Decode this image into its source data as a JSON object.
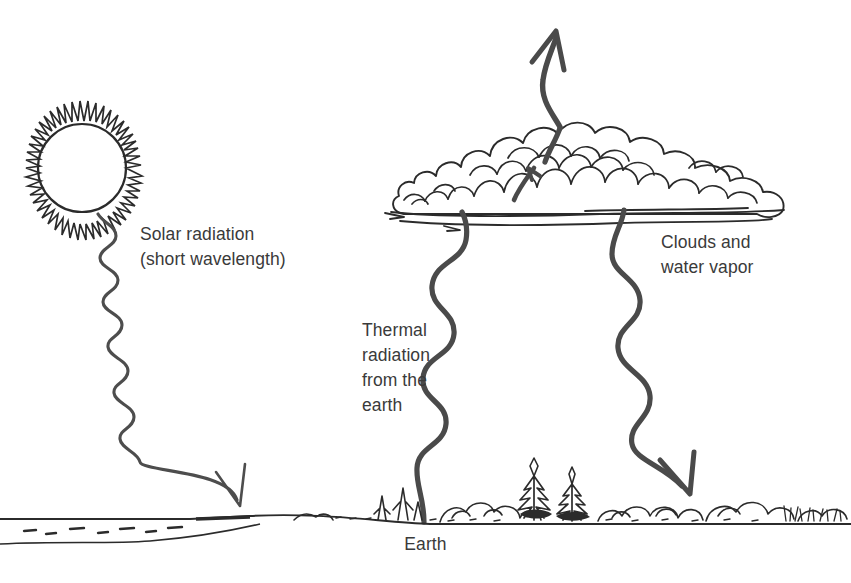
{
  "diagram": {
    "background_color": "#ffffff",
    "ink_color": "#2b2b2b",
    "wave_color": "#4a4a4a",
    "text_color": "#3a3a3a"
  },
  "labels": {
    "solar_line1": "Solar radiation",
    "solar_line2": "(short wavelength)",
    "thermal_line1": "Thermal",
    "thermal_line2": "radiation",
    "thermal_line3": "from the",
    "thermal_line4": "earth",
    "clouds_line1": "Clouds and",
    "clouds_line2": "water vapor",
    "earth": "Earth"
  },
  "elements": {
    "sun": "sun-with-rays",
    "cloud": "cumulus-cloud",
    "landscape": "treeline-horizon",
    "water": "water-shoreline",
    "solar_ray": "downward-wavy-arrow",
    "thermal_ray": "upward-wavy-arrow",
    "backradiation_ray": "downward-wavy-arrow",
    "escaping_ray": "upward-straight-arrow"
  }
}
